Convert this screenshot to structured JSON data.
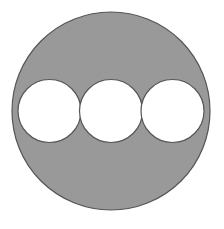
{
  "figure": {
    "name": "three-circles-inscribed-in-large-circle",
    "canvas": {
      "width": 224,
      "height": 229
    },
    "background_color": "#ffffff",
    "colors": {
      "shaded_fill": "#999999",
      "circle_fill": "#ffffff",
      "outline_stroke": "#555555",
      "diameter_line": "#3a3a3a"
    },
    "large_circle": {
      "label": "large-circle",
      "cx": 111,
      "cy": 111,
      "r": 99,
      "fill": "#999999",
      "stroke": "#555555",
      "stroke_width": 1.2
    },
    "inner_circles": [
      {
        "label": "left-circle",
        "cx": 49.5,
        "cy": 111,
        "r": 31.5,
        "fill": "#ffffff",
        "stroke": "#555555",
        "stroke_width": 1.2
      },
      {
        "label": "middle-circle",
        "cx": 111,
        "cy": 111,
        "r": 31.5,
        "fill": "#ffffff",
        "stroke": "#555555",
        "stroke_width": 1.2
      },
      {
        "label": "right-circle",
        "cx": 172.5,
        "cy": 111,
        "r": 31.5,
        "fill": "#ffffff",
        "stroke": "#555555",
        "stroke_width": 1.2
      }
    ],
    "diameter_line": {
      "label": "horizontal-diameter",
      "x1": 12,
      "y1": 111,
      "x2": 210,
      "y2": 111,
      "stroke": "#3a3a3a",
      "stroke_width": 1
    }
  }
}
